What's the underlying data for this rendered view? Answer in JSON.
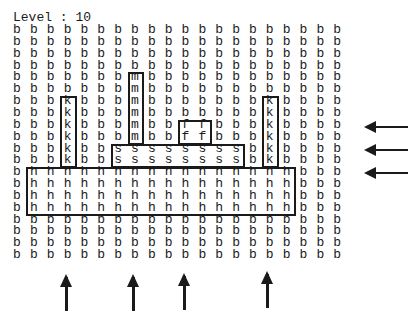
{
  "title": "Level : 10",
  "level": 10,
  "grid": {
    "cols": 20,
    "rows": 20,
    "cells": [
      "bbbbbbbbbbbbbbbbbbbb",
      "bbbbbbbbbbbbbbbbbbbb",
      "bbbbbbbbbbbbbbbbbbbb",
      "bbbbbbbbbbbbbbbbbbbb",
      "bbbbbbbmbbbbbbbbbbbb",
      "bbbbbbbmbbbbbbbbbbbb",
      "bbbkbbbmbbbbbbbkbbbb",
      "bbbkbbbmbbbbbbbkbbbb",
      "bbbkbbbmbbffbbbkbbbb",
      "bbbkbbbmbbffbbbkbbbb",
      "bbbkbbssssssssbkbbbb",
      "bbbkbbssssssssbkbbbb",
      "bhhhhhhhhhhhhhhhhbbb",
      "bhhhhhhhhhhhhhhhhbbb",
      "bhhhhhhhhhhhhhhhhbbb",
      "bhhhhhhhhhhhhhhhhbbb",
      "bbbbbbbbbbbbbbbbbbbb",
      "bbbbbbbbbbbbbbbbbbbb",
      "bbbbbbbbbbbbbbbbbbbb",
      "bbbbbbbbbbbbbbbbbbbb"
    ]
  },
  "pieces": [
    {
      "name": "piece-k-left",
      "letter": "k",
      "col": 3,
      "row": 6,
      "w": 1,
      "h": 6
    },
    {
      "name": "piece-m",
      "letter": "m",
      "col": 7,
      "row": 4,
      "w": 1,
      "h": 6
    },
    {
      "name": "piece-f",
      "letter": "f",
      "col": 10,
      "row": 8,
      "w": 2,
      "h": 2
    },
    {
      "name": "piece-s",
      "letter": "s",
      "col": 6,
      "row": 10,
      "w": 8,
      "h": 2
    },
    {
      "name": "piece-k-right",
      "letter": "k",
      "col": 15,
      "row": 6,
      "w": 1,
      "h": 6
    },
    {
      "name": "piece-h",
      "letter": "h",
      "col": 1,
      "row": 12,
      "w": 16,
      "h": 4
    }
  ],
  "arrows": {
    "left": [
      {
        "name": "left-arrow-1",
        "y": 127,
        "x1": 366,
        "x2": 408
      },
      {
        "name": "left-arrow-2",
        "y": 150,
        "x1": 366,
        "x2": 408
      },
      {
        "name": "left-arrow-3",
        "y": 173,
        "x1": 366,
        "x2": 408
      }
    ],
    "up": [
      {
        "name": "up-arrow-1",
        "x": 66,
        "y1": 277,
        "y2": 311
      },
      {
        "name": "up-arrow-2",
        "x": 133,
        "y1": 277,
        "y2": 311
      },
      {
        "name": "up-arrow-3",
        "x": 184,
        "y1": 276,
        "y2": 310
      },
      {
        "name": "up-arrow-4",
        "x": 267,
        "y1": 274,
        "y2": 308
      }
    ]
  },
  "colors": {
    "ink": "#1a1a1a",
    "background": "#ffffff"
  }
}
